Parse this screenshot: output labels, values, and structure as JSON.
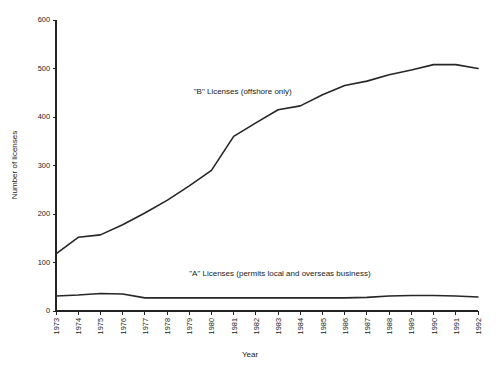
{
  "chart_data": {
    "type": "line",
    "title": "",
    "xlabel": "Year",
    "ylabel": "Number of licenses",
    "grid": false,
    "legend_position": "inline-annotations",
    "xlim": [
      1973,
      1992
    ],
    "ylim": [
      0,
      600
    ],
    "ytick_values": [
      0,
      100,
      200,
      300,
      400,
      500,
      600
    ],
    "ytick_labels": [
      "0",
      "100",
      "200",
      "300",
      "400",
      "500",
      "600"
    ],
    "x": [
      1973,
      1974,
      1975,
      1976,
      1977,
      1978,
      1979,
      1980,
      1981,
      1982,
      1983,
      1984,
      1985,
      1986,
      1987,
      1988,
      1989,
      1990,
      1991,
      1992
    ],
    "xtick_labels": [
      "1973",
      "1974",
      "1975",
      "1976",
      "1977",
      "1978",
      "1979",
      "1980",
      "1981",
      "1982",
      "1983",
      "1984",
      "1985",
      "1986",
      "1987",
      "1988",
      "1989",
      "1990",
      "1991",
      "1992"
    ],
    "series": [
      {
        "name": "\"B\" Licenses (offshore only)",
        "annotation": "\"B\" Licenses (offshore only)",
        "color": "#262626",
        "values": [
          118,
          152,
          157,
          178,
          202,
          228,
          258,
          290,
          360,
          388,
          415,
          423,
          446,
          465,
          474,
          487,
          497,
          508,
          508,
          500
        ]
      },
      {
        "name": "\"A\" Licenses (permits local and overseas business)",
        "annotation": "\"A\" Licenses (permits local and overseas business)",
        "color": "#262626",
        "values": [
          31,
          33,
          36,
          35,
          27,
          27,
          27,
          27,
          27,
          27,
          27,
          27,
          27,
          27,
          28,
          31,
          32,
          32,
          31,
          29
        ]
      }
    ],
    "annotations": [
      {
        "text": "\"B\" Licenses (offshore only)",
        "x_year": 1979.2,
        "y_value": 447
      },
      {
        "text": "\"A\" Licenses (permits local and overseas business)",
        "x_year": 1979.0,
        "y_value": 72
      }
    ]
  }
}
